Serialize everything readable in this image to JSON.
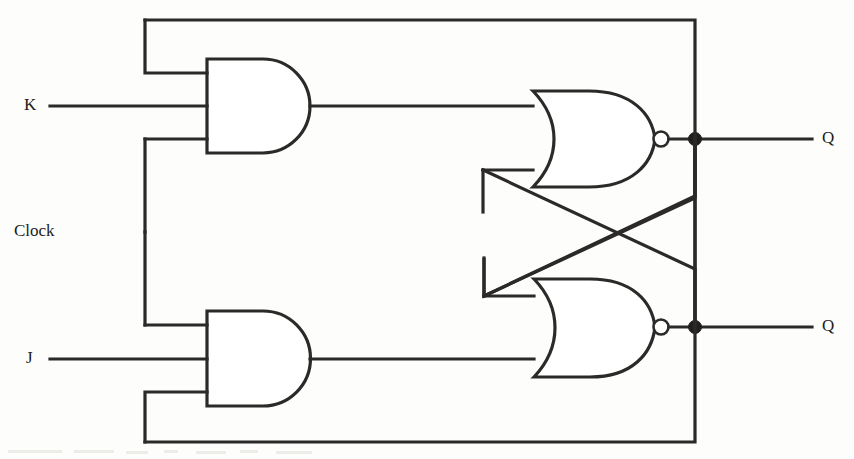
{
  "figure": {
    "width": 854,
    "height": 459,
    "background_color": "#fdfdfc",
    "line_color": "#2b2a28"
  },
  "labels": {
    "k_input": "K",
    "clock_input": "Clock",
    "j_input": "J",
    "q_output": "Q",
    "q_not_output": "Q"
  },
  "gates": [
    {
      "id": "and-top",
      "type": "AND",
      "inputs": 3,
      "input_names": [
        "q-not-feedback",
        "K",
        "Clock"
      ],
      "output_name": "and-top-output"
    },
    {
      "id": "and-bottom",
      "type": "AND",
      "inputs": 3,
      "input_names": [
        "Clock",
        "J",
        "q-feedback"
      ],
      "output_name": "and-bottom-output"
    },
    {
      "id": "nor-top",
      "type": "NOR",
      "inputs": 2,
      "input_names": [
        "and-top-output",
        "q-not-cross"
      ],
      "output_name": "Q"
    },
    {
      "id": "nor-bottom",
      "type": "NOR",
      "inputs": 2,
      "input_names": [
        "q-cross",
        "and-bottom-output"
      ],
      "output_name": "Q"
    }
  ],
  "nodes": [
    {
      "id": "clock-junction",
      "x": 145,
      "y": 232
    },
    {
      "id": "q-output-junction",
      "x": 695,
      "y": 139
    },
    {
      "id": "q-not-output-junction",
      "x": 695,
      "y": 327
    }
  ]
}
